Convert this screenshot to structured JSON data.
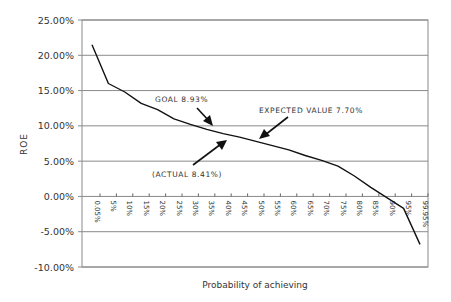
{
  "chart_data": {
    "type": "line",
    "title": "",
    "xlabel": "Probability of achieving",
    "ylabel": "ROE",
    "ylim": [
      -0.1,
      0.25
    ],
    "y_ticks": [
      "25.00%",
      "20.00%",
      "15.00%",
      "10.00%",
      "5.00%",
      "0.00%",
      "-5.00%",
      "-10.00%"
    ],
    "y_tick_values": [
      0.25,
      0.2,
      0.15,
      0.1,
      0.05,
      0.0,
      -0.05,
      -0.1
    ],
    "grid": true,
    "legend": null,
    "categories": [
      "0.05%",
      "5%",
      "10%",
      "15%",
      "20%",
      "25%",
      "30%",
      "35%",
      "40%",
      "45%",
      "50%",
      "55%",
      "60%",
      "65%",
      "70%",
      "75%",
      "80%",
      "85%",
      "90%",
      "95%",
      "99.95%"
    ],
    "series": [
      {
        "name": "ROE",
        "color": "#111111",
        "values": [
          0.215,
          0.16,
          0.148,
          0.132,
          0.123,
          0.11,
          0.102,
          0.095,
          0.089,
          0.084,
          0.078,
          0.072,
          0.066,
          0.058,
          0.051,
          0.043,
          0.029,
          0.013,
          -0.002,
          -0.017,
          -0.068
        ]
      }
    ],
    "annotations": [
      {
        "text": "GOAL 8.93%",
        "value": 0.0893
      },
      {
        "text": "EXPECTED VALUE 7.70%",
        "value": 0.077
      },
      {
        "text": "(ACTUAL 8.41%)",
        "value": 0.0841
      }
    ]
  }
}
